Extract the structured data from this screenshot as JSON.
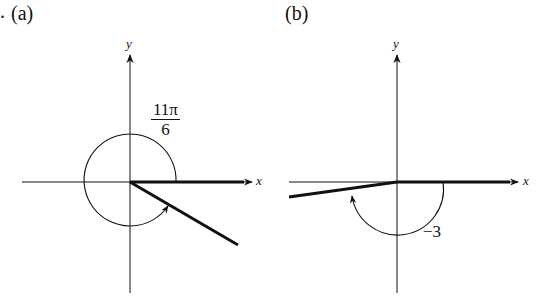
{
  "panels": [
    {
      "id": "a",
      "label": "(a)",
      "prefix": ".",
      "axes": {
        "x_label": "x",
        "y_label": "y"
      },
      "angle": {
        "numerator": "11π",
        "denominator": "6",
        "direction": "counterclockwise",
        "radians": "11π/6"
      }
    },
    {
      "id": "b",
      "label": "(b)",
      "axes": {
        "x_label": "x",
        "y_label": "y"
      },
      "angle": {
        "label": "−3",
        "direction": "clockwise",
        "radians": "-3"
      }
    }
  ]
}
